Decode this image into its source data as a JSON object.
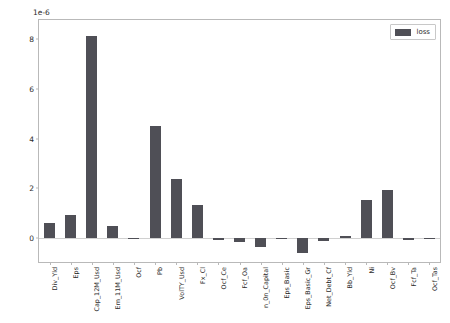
{
  "chart_data": {
    "type": "bar",
    "title": "",
    "xlabel": "",
    "ylabel": "",
    "offset_text": "1e-6",
    "grid": false,
    "legend_position": "upper right",
    "bar_color": "#4f4f56",
    "ylim": [
      -0.95,
      8.75
    ],
    "yticks": [
      0,
      2,
      4,
      6,
      8
    ],
    "ytick_labels": [
      "0",
      "2",
      "4",
      "6",
      "8"
    ],
    "categories": [
      "Div_Yld",
      "Eps",
      "Cap_12M_Usd",
      "Em_11M_Usd",
      "Ocf",
      "Pb",
      "VolTY_Usd",
      "Fx_Cl",
      "Ocf_Ce",
      "Fcf_Oa",
      "n_0n_Capital",
      "Eps_Basic",
      "Eps_Basic_Gr",
      "Net_Debt_Cf",
      "Bb_Yld",
      "Ni",
      "Ocf_Bv",
      "Fcf_Ta",
      "Ocf_Tas"
    ],
    "series": [
      {
        "name": "loss",
        "values": [
          0.6,
          0.93,
          8.1,
          0.5,
          -0.03,
          4.52,
          2.37,
          1.35,
          -0.08,
          -0.14,
          -0.35,
          -0.02,
          -0.6,
          -0.12,
          0.08,
          1.55,
          1.92,
          -0.05,
          -0.02
        ]
      }
    ],
    "value_scale_note": "values are in units of 1e-6"
  },
  "legend": {
    "entries": [
      {
        "label": "loss",
        "color": "#4f4f56"
      }
    ]
  }
}
